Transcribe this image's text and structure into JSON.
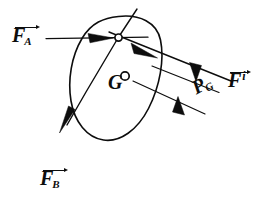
{
  "figure": {
    "domain": "diagram",
    "background_color": "#ffffff",
    "ink_color": "#0d0d0d",
    "width": 269,
    "height": 215
  },
  "labels": {
    "force_a": {
      "base": "F",
      "sub": "A",
      "sup": "",
      "vector": true,
      "name": "F_A"
    },
    "force_b": {
      "base": "F",
      "sub": "B",
      "sup": "",
      "vector": true,
      "name": "F_B"
    },
    "force_i": {
      "base": "F",
      "sub": "",
      "sup": "i",
      "vector": true,
      "name": "F^i"
    },
    "distance_pg": {
      "base": "P",
      "sub": "G",
      "sup": "",
      "vector": false,
      "name": "P_G"
    },
    "center_of_gravity": {
      "base": "G",
      "sub": "",
      "sup": "",
      "vector": false,
      "name": "G"
    }
  },
  "elements": {
    "body_outline": "ellipse",
    "center_of_gravity_marker": "small-open-circle",
    "pivot_node_marker": "small-open-circle",
    "force_a_arrow": "arrow-pointing-right",
    "force_b_arrow": "arrow-pointing-down-left",
    "force_i_arrow": "arrow-pointing-down-right",
    "dimension_arrows": "two-opposing-arrows"
  }
}
